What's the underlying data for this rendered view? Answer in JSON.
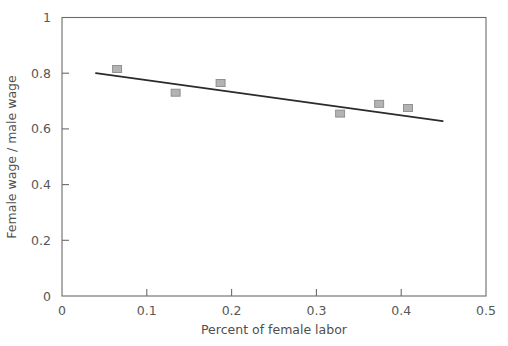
{
  "chart_data": {
    "type": "scatter",
    "title": "",
    "xlabel": "Percent of female labor",
    "ylabel": "Female wage / male wage",
    "xlim": [
      0,
      0.5
    ],
    "ylim": [
      0,
      1
    ],
    "grid": false,
    "legend": "none",
    "x_ticks": [
      "0",
      "0.1",
      "0.2",
      "0.3",
      "0.4",
      "0.5"
    ],
    "x_tick_values": [
      0,
      0.1,
      0.2,
      0.3,
      0.4,
      0.5
    ],
    "y_ticks": [
      "0",
      "0.2",
      "0.4",
      "0.6",
      "0.8",
      "1"
    ],
    "y_tick_values": [
      0,
      0.2,
      0.4,
      0.6,
      0.8,
      1
    ],
    "series": [
      {
        "name": "observations",
        "marker": "square",
        "marker_color": "#b3b3b3",
        "marker_edge_color": "#8a8a8a",
        "points": [
          {
            "x": 0.065,
            "y": 0.815
          },
          {
            "x": 0.134,
            "y": 0.73
          },
          {
            "x": 0.187,
            "y": 0.765
          },
          {
            "x": 0.328,
            "y": 0.655
          },
          {
            "x": 0.374,
            "y": 0.69
          },
          {
            "x": 0.408,
            "y": 0.675
          }
        ]
      },
      {
        "name": "trend-line",
        "type": "line",
        "color": "#2b2b2b",
        "points": [
          {
            "x": 0.04,
            "y": 0.8
          },
          {
            "x": 0.449,
            "y": 0.628
          }
        ]
      }
    ]
  },
  "axes": {
    "x_title": "Percent of female labor",
    "y_title": "Female wage / male wage"
  }
}
